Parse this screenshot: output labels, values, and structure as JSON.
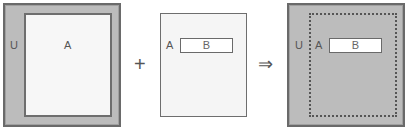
{
  "diagram": {
    "panel1": {
      "outer_label": "U",
      "inner_label": "A"
    },
    "plus_operator": "+",
    "panel2": {
      "outer_label": "A",
      "inner_label": "B"
    },
    "implies_operator": "⇒",
    "panel3": {
      "outer_label": "U",
      "middle_label": "A",
      "inner_label": "B"
    },
    "colors": {
      "universe_fill": "#bcbcbc",
      "border": "#6a6a6a",
      "set_fill": "#f7f7f7",
      "box_fill": "#ffffff"
    }
  }
}
